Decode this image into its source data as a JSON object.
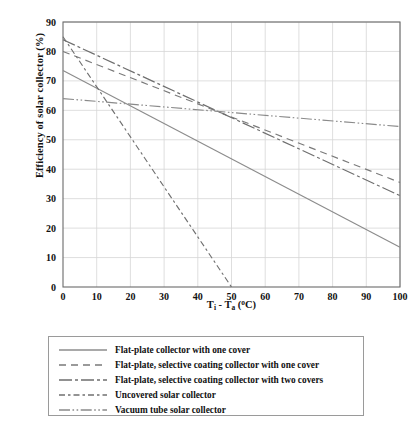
{
  "chart_data": {
    "type": "line",
    "title": "",
    "xlabel": "Ti - Ta (oC)",
    "xlabel_parts": {
      "lead": "T",
      "sub1": "i",
      "mid": " - T",
      "sub2": "a",
      "open": " (",
      "deg": "o",
      "tail": "C)"
    },
    "ylabel": "Efficiency of solar collector (%)",
    "xlim": [
      0,
      100
    ],
    "ylim": [
      0,
      90
    ],
    "xticks": [
      0,
      10,
      20,
      30,
      40,
      50,
      60,
      70,
      80,
      90,
      100
    ],
    "yticks": [
      0,
      10,
      20,
      30,
      40,
      50,
      60,
      70,
      80,
      90
    ],
    "grid": true,
    "legend_position": "below-plot",
    "series": [
      {
        "name": "Flat-plate collector with one cover",
        "dash": "solid",
        "color": "#8c8c8c",
        "x": [
          0,
          100
        ],
        "values": [
          73.5,
          13.5
        ]
      },
      {
        "name": "Flat-plate, selective coating collector with one cover",
        "dash": "dashed",
        "color": "#7a7a7a",
        "x": [
          0,
          100
        ],
        "values": [
          80.0,
          35.5
        ]
      },
      {
        "name": "Flat-plate, selective coating collector with two covers",
        "dash": "dash-dot-long",
        "color": "#6e6e6e",
        "x": [
          0,
          100
        ],
        "values": [
          84.0,
          31.0
        ]
      },
      {
        "name": "Uncovered solar collector",
        "dash": "dash-dot",
        "color": "#707070",
        "x": [
          0,
          50
        ],
        "values": [
          85.0,
          0.0
        ]
      },
      {
        "name": "Vacuum tube solar collector",
        "dash": "dash-dot-dot",
        "color": "#8a8a8a",
        "x": [
          0,
          100
        ],
        "values": [
          64.0,
          54.5
        ]
      }
    ]
  },
  "axis": {
    "x_tick_labels": [
      "0",
      "10",
      "20",
      "30",
      "40",
      "50",
      "60",
      "70",
      "80",
      "90",
      "100"
    ],
    "y_tick_labels": [
      "0",
      "10",
      "20",
      "30",
      "40",
      "50",
      "60",
      "70",
      "80",
      "90"
    ]
  },
  "legend": {
    "items": [
      {
        "label": "Flat-plate collector with one cover"
      },
      {
        "label": "Flat-plate, selective coating collector with one cover"
      },
      {
        "label": "Flat-plate, selective coating collector with two covers"
      },
      {
        "label": "Uncovered solar collector"
      },
      {
        "label": "Vacuum tube solar collector"
      }
    ]
  },
  "colors": {
    "grid": "#d6d6d6",
    "axis": "#6b6b6b",
    "text": "#111111",
    "legend_border": "#9a9a9a",
    "background": "#ffffff"
  }
}
